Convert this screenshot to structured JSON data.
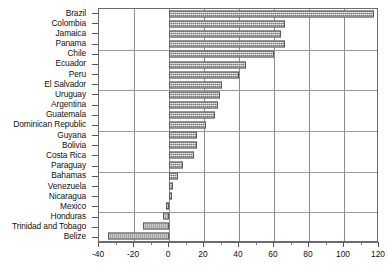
{
  "chart_data": {
    "type": "bar",
    "orientation": "horizontal",
    "title": "",
    "subtitle": "",
    "xlabel": "",
    "ylabel": "",
    "xlim": [
      -40,
      120
    ],
    "ylim": null,
    "grid": true,
    "grid_axis": "x",
    "legend": null,
    "legend_position": "none",
    "x_ticks": [
      -40,
      -20,
      0,
      20,
      40,
      60,
      80,
      100,
      120
    ],
    "x_tick_labels": [
      "-40",
      "-20",
      "0",
      "20",
      "40",
      "60",
      "80",
      "100",
      "120"
    ],
    "x_minor_tick_interval": 10,
    "categories": [
      "Brazil",
      "Colombia",
      "Jamaica",
      "Panama",
      "Chile",
      "Ecuador",
      "Peru",
      "El Salvador",
      "Uruguay",
      "Argentina",
      "Guatemala",
      "Dominican Republic",
      "Guyana",
      "Bolivia",
      "Costa Rica",
      "Paraguay",
      "Bahamas",
      "Venezuela",
      "Nicaragua",
      "Mexico",
      "Honduras",
      "Trinidad and Tobago",
      "Belize"
    ],
    "values": [
      117,
      66,
      64,
      66,
      60,
      44,
      40,
      30,
      29,
      28,
      26,
      21,
      16,
      16,
      14,
      8,
      5,
      2,
      1.5,
      -2,
      -3.5,
      -15,
      -35
    ],
    "bar_fill_color": "#a8a8a8",
    "bar_edge_color": "#5a5a5a",
    "bar_pattern": "stippled",
    "axis_color": "#6b6b6b",
    "grid_color": "#8c8c8c",
    "background_color": "#ffffff"
  }
}
